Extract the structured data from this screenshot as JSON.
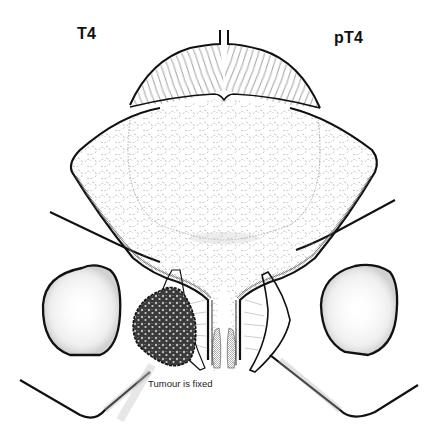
{
  "figure": {
    "label_left": "T4",
    "label_right": "pT4",
    "caption": "Tumour is fixed",
    "colors": {
      "ink": "#111111",
      "fine_line": "#555555",
      "texture": "#8a8a8a",
      "stipple": "#9a9a9a",
      "tumour_dark": "#2b2b2b",
      "background": "#ffffff"
    },
    "elements": [
      "bladder-dome-muscle",
      "bladder-body-texture",
      "bladder-wall-left",
      "bladder-wall-right",
      "urethra",
      "seminal-vesicle-left",
      "seminal-vesicle-right",
      "pelvic-bone-left",
      "pelvic-bone-right",
      "obturator-foramen-left",
      "obturator-foramen-right",
      "tumour-mass"
    ]
  }
}
